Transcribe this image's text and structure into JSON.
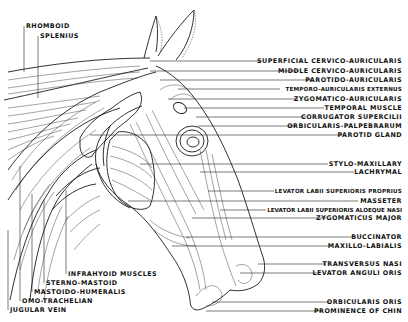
{
  "diagram": {
    "left_labels": [
      {
        "id": "rhomboid",
        "text": "RHOMBOID"
      },
      {
        "id": "splenius",
        "text": "SPLENIUS"
      },
      {
        "id": "infrahyoid",
        "text": "INFRAHYOID MUSCLES"
      },
      {
        "id": "sterno-mastoid",
        "text": "STERNO-MASTOID"
      },
      {
        "id": "mastoido-humeralis",
        "text": "MASTOIDO-HUMERALIS"
      },
      {
        "id": "omo-trachelian",
        "text": "OMO-TRACHELIAN"
      },
      {
        "id": "jugular-vein",
        "text": "JUGULAR VEIN"
      }
    ],
    "right_labels": [
      {
        "id": "superficial-cervico-auricularis",
        "text": "SUPERFICIAL CERVICO-AURICULARIS"
      },
      {
        "id": "middle-cervico-auricularis",
        "text": "MIDDLE CERVICO-AURICULARIS"
      },
      {
        "id": "parotido-auricularis",
        "text": "PAROTIDO-AURICULARIS"
      },
      {
        "id": "temporo-auricularis-externus",
        "text": "TEMPORO-AURICULARIS EXTERNUS"
      },
      {
        "id": "zygomatico-auricularis",
        "text": "ZYGOMATICO-AURICULARIS"
      },
      {
        "id": "temporal-muscle",
        "text": "TEMPORAL MUSCLE"
      },
      {
        "id": "corrugator-supercilii",
        "text": "CORRUGATOR SUPERCILII"
      },
      {
        "id": "orbicularis-palpebrarum",
        "text": "ORBICULARIS-PALPEBRARUM"
      },
      {
        "id": "parotid-gland",
        "text": "PAROTID GLAND"
      },
      {
        "id": "stylo-maxillary",
        "text": "STYLO-MAXILLARY"
      },
      {
        "id": "lachrymal",
        "text": "LACHRYMAL"
      },
      {
        "id": "levator-labii-superioris-proprius",
        "text": "LEVATOR LABII SUPERIORIS PROPRIUS"
      },
      {
        "id": "masseter",
        "text": "MASSETER"
      },
      {
        "id": "levator-labii-superioris-aloeque-nasi",
        "text": "LEVATOR LABII SUPERIORIS ALOEQUE NASI"
      },
      {
        "id": "zygomaticus-major",
        "text": "ZYGOMATICUS MAJOR"
      },
      {
        "id": "buccinator",
        "text": "BUCCINATOR"
      },
      {
        "id": "maxillo-labialis",
        "text": "MAXILLO-LABIALIS"
      },
      {
        "id": "transversus-nasi",
        "text": "TRANSVERSUS NASI"
      },
      {
        "id": "levator-anguli-oris",
        "text": "LEVATOR ANGULI ORIS"
      },
      {
        "id": "orbicularis-oris",
        "text": "ORBICULARIS ORIS"
      },
      {
        "id": "prominence-of-chin",
        "text": "PROMINENCE OF CHIN"
      }
    ]
  }
}
